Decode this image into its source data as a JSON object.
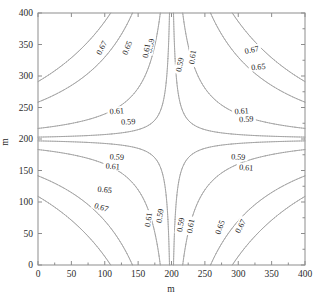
{
  "chart_data": {
    "type": "contour",
    "title": "",
    "xlabel": "m",
    "ylabel": "m",
    "xlim": [
      0,
      400
    ],
    "ylim": [
      0,
      400
    ],
    "xticks": [
      0,
      50,
      100,
      150,
      200,
      250,
      300,
      350,
      400
    ],
    "yticks": [
      0,
      50,
      100,
      150,
      200,
      250,
      300,
      350,
      400
    ],
    "xtick_labels": [
      "0",
      "50",
      "100",
      "150",
      "200",
      "250",
      "300",
      "350",
      "400"
    ],
    "ytick_labels": [
      "0",
      "50",
      "100",
      "150",
      "200",
      "250",
      "300",
      "350",
      "400"
    ],
    "levels": [
      0.59,
      0.61,
      0.65,
      0.67
    ],
    "level_labels": [
      "0.59",
      "0.61",
      "0.65",
      "0.67"
    ],
    "grid": false,
    "legend": false,
    "line_color": "#9a9a9a",
    "frame_color": "#8d8d8d",
    "background": "#ffffff",
    "contour_labels": [
      {
        "text": "0.67",
        "x": 95,
        "y": 345,
        "rotation": -62
      },
      {
        "text": "0.65",
        "x": 133,
        "y": 345,
        "rotation": -68
      },
      {
        "text": "0.59",
        "x": 168,
        "y": 348,
        "rotation": -80
      },
      {
        "text": "0.61",
        "x": 162,
        "y": 340,
        "rotation": -80
      },
      {
        "text": "0.59",
        "x": 212,
        "y": 318,
        "rotation": -78
      },
      {
        "text": "0.61",
        "x": 231,
        "y": 330,
        "rotation": -82
      },
      {
        "text": "0.67",
        "x": 320,
        "y": 342,
        "rotation": -12
      },
      {
        "text": "0.65",
        "x": 330,
        "y": 315,
        "rotation": -6
      },
      {
        "text": "0.61",
        "x": 118,
        "y": 245,
        "rotation": -4
      },
      {
        "text": "0.59",
        "x": 135,
        "y": 228,
        "rotation": -4
      },
      {
        "text": "0.61",
        "x": 305,
        "y": 245,
        "rotation": -4
      },
      {
        "text": "0.59",
        "x": 312,
        "y": 232,
        "rotation": -4
      },
      {
        "text": "0.59",
        "x": 118,
        "y": 172,
        "rotation": 4
      },
      {
        "text": "0.61",
        "x": 112,
        "y": 157,
        "rotation": 4
      },
      {
        "text": "0.59",
        "x": 300,
        "y": 172,
        "rotation": 4
      },
      {
        "text": "0.61",
        "x": 312,
        "y": 155,
        "rotation": 4
      },
      {
        "text": "0.65",
        "x": 100,
        "y": 120,
        "rotation": 6
      },
      {
        "text": "0.67",
        "x": 95,
        "y": 92,
        "rotation": 18
      },
      {
        "text": "0.61",
        "x": 165,
        "y": 72,
        "rotation": -82
      },
      {
        "text": "0.59",
        "x": 182,
        "y": 78,
        "rotation": -82
      },
      {
        "text": "0.59",
        "x": 213,
        "y": 64,
        "rotation": -80
      },
      {
        "text": "0.61",
        "x": 228,
        "y": 62,
        "rotation": -80
      },
      {
        "text": "0.65",
        "x": 272,
        "y": 60,
        "rotation": -70
      },
      {
        "text": "0.67",
        "x": 303,
        "y": 62,
        "rotation": -62
      }
    ]
  }
}
